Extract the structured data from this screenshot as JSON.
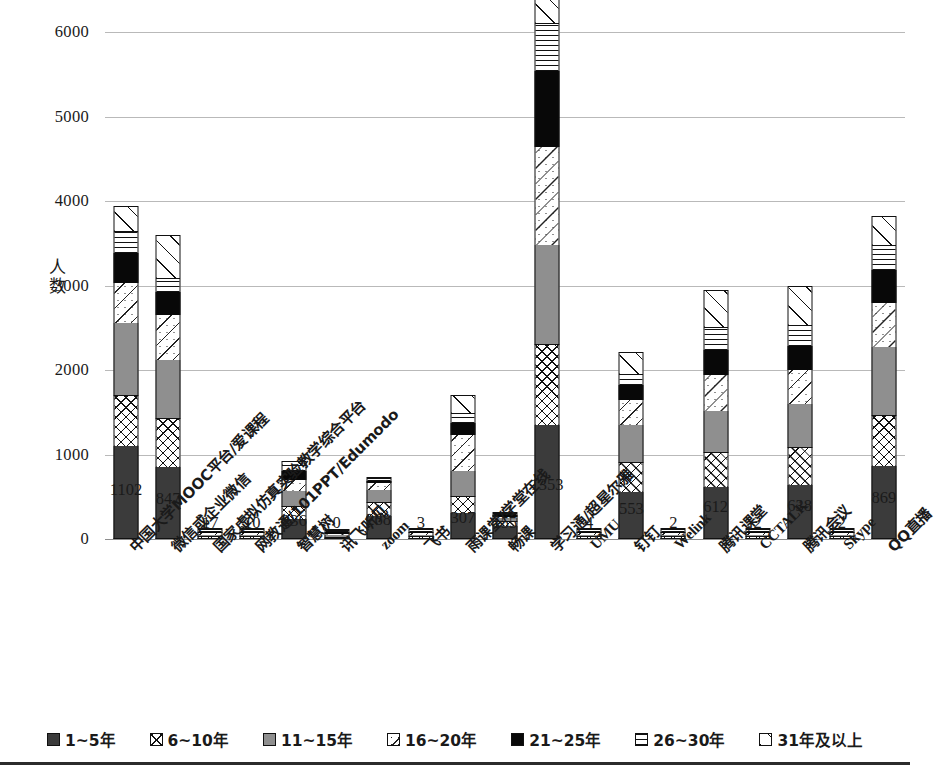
{
  "chart_data": {
    "type": "bar",
    "stacked": true,
    "title": "",
    "xlabel": "",
    "ylabel": "人数",
    "ylim": [
      0,
      6000
    ],
    "ytick_values": [
      0,
      1000,
      2000,
      3000,
      4000,
      5000,
      6000
    ],
    "ytick_labels": [
      "0",
      "1000",
      "2000",
      "3000",
      "4000",
      "5000",
      "6000"
    ],
    "grid": true,
    "legend_position": "bottom",
    "categories": [
      "中国大学MOOC平台/爱课程",
      "微信或企业微信",
      "国家虚拟仿真实验教学综合平台",
      "网教通/101PPT/Edumodo",
      "智慧树",
      "讯飞听见",
      "zoom",
      "飞书",
      "雨课堂/学堂在线",
      "畅课",
      "学习通/超星尔雅",
      "UMU",
      "钉钉",
      "Welink",
      "腾讯课堂",
      "CCTALK",
      "腾讯会议",
      "Skype",
      "QQ直播"
    ],
    "category_is_latin": [
      false,
      false,
      false,
      false,
      false,
      false,
      true,
      false,
      false,
      false,
      false,
      true,
      false,
      true,
      false,
      true,
      false,
      true,
      false
    ],
    "series": [
      {
        "name": "1~5年",
        "pattern": "p-s1",
        "values": [
          1102,
          847,
          17,
          10,
          236,
          0,
          268,
          3,
          307,
          155,
          1353,
          4,
          553,
          2,
          612,
          2,
          638,
          2,
          869
        ]
      },
      {
        "name": "6~10年",
        "pattern": "p-s2",
        "values": [
          600,
          580,
          4,
          3,
          150,
          1,
          170,
          2,
          200,
          60,
          950,
          1,
          360,
          1,
          420,
          1,
          450,
          1,
          600
        ]
      },
      {
        "name": "11~15年",
        "pattern": "p-s3",
        "values": [
          860,
          690,
          2,
          2,
          180,
          1,
          140,
          1,
          300,
          30,
          1180,
          1,
          440,
          1,
          480,
          1,
          510,
          1,
          800
        ]
      },
      {
        "name": "16~20年",
        "pattern": "p-s4",
        "values": [
          470,
          530,
          1,
          1,
          130,
          1,
          80,
          1,
          420,
          20,
          1160,
          1,
          290,
          1,
          430,
          1,
          400,
          1,
          530
        ]
      },
      {
        "name": "21~25年",
        "pattern": "p-s5",
        "values": [
          350,
          280,
          1,
          1,
          110,
          1,
          30,
          1,
          150,
          15,
          900,
          1,
          180,
          1,
          300,
          1,
          290,
          1,
          390
        ]
      },
      {
        "name": "26~30年",
        "pattern": "p-s6",
        "values": [
          250,
          150,
          1,
          1,
          60,
          1,
          20,
          1,
          100,
          10,
          550,
          1,
          120,
          1,
          250,
          1,
          230,
          1,
          280
        ]
      },
      {
        "name": "31年及以上",
        "pattern": "p-s7",
        "values": [
          310,
          520,
          1,
          1,
          60,
          1,
          20,
          1,
          230,
          10,
          480,
          1,
          270,
          1,
          450,
          1,
          480,
          1,
          350
        ]
      }
    ],
    "bar_labels": [
      "1102",
      "847",
      "17",
      "10",
      "236",
      "0",
      "268",
      "3",
      "307",
      "155",
      "1353",
      "4",
      "553",
      "2",
      "612",
      "2",
      "638",
      "2",
      "869"
    ]
  },
  "legend": {
    "items": [
      {
        "label": "1~5年",
        "pattern": "p-s1"
      },
      {
        "label": "6~10年",
        "pattern": "p-s2"
      },
      {
        "label": "11~15年",
        "pattern": "p-s3"
      },
      {
        "label": "16~20年",
        "pattern": "p-s4"
      },
      {
        "label": "21~25年",
        "pattern": "p-s5"
      },
      {
        "label": "26~30年",
        "pattern": "p-s6"
      },
      {
        "label": "31年及以上",
        "pattern": "p-s7"
      }
    ]
  }
}
